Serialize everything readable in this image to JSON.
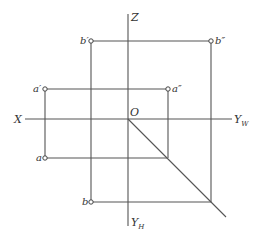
{
  "diagram": {
    "colors": {
      "line": "#555555",
      "text": "#333333",
      "background": "#ffffff"
    },
    "origin": {
      "label": "O",
      "x": 128,
      "y": 119
    },
    "axes": {
      "x": {
        "label": "X"
      },
      "z": {
        "label": "Z"
      },
      "yw": {
        "label": "Y",
        "subscript": "W"
      },
      "yh": {
        "label": "Y",
        "subscript": "H"
      }
    },
    "points": {
      "a_prime": {
        "label": "a′",
        "x": 45,
        "y": 89
      },
      "a_double_prime": {
        "label": "a″",
        "x": 168,
        "y": 89
      },
      "a": {
        "label": "a",
        "x": 45,
        "y": 158
      },
      "b_prime": {
        "label": "b′",
        "x": 91,
        "y": 41
      },
      "b_double_prime": {
        "label": "b″",
        "x": 211,
        "y": 41
      },
      "b": {
        "label": "b",
        "x": 91,
        "y": 202
      }
    }
  }
}
